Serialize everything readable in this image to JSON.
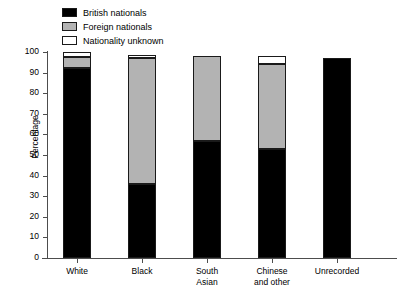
{
  "chart_data": {
    "type": "bar",
    "subtype": "stacked-bar",
    "title": "",
    "xlabel": "",
    "ylabel": "Percentage",
    "ylim": [
      0,
      100
    ],
    "yticks": [
      0,
      10,
      20,
      30,
      40,
      50,
      60,
      70,
      80,
      90,
      100
    ],
    "grid": false,
    "legend_position": "top-left",
    "categories": [
      "White",
      "Black",
      "South Asian",
      "Chinese and other",
      "Unrecorded"
    ],
    "category_lines": [
      [
        "White"
      ],
      [
        "Black"
      ],
      [
        "South",
        "Asian"
      ],
      [
        "Chinese",
        "and other"
      ],
      [
        "Unrecorded"
      ]
    ],
    "series": [
      {
        "name": "British nationals",
        "color": "#000000",
        "values": [
          92,
          36,
          57,
          53,
          97
        ]
      },
      {
        "name": "Foreign nationals",
        "color": "#b3b3b3",
        "values": [
          5.5,
          61,
          41,
          41,
          0
        ]
      },
      {
        "name": "Nationality unknown",
        "color": "#ffffff",
        "values": [
          2.5,
          1.5,
          0,
          4,
          0
        ]
      }
    ],
    "bar_totals": [
      100,
      98.5,
      98,
      98,
      97
    ]
  },
  "legend": {
    "items": [
      {
        "label": "British nationals",
        "swatch": "#000000"
      },
      {
        "label": "Foreign nationals",
        "swatch": "#b3b3b3"
      },
      {
        "label": "Nationality unknown",
        "swatch": "#ffffff"
      }
    ]
  },
  "axes": {
    "y_title": "Percentage",
    "y_tick_labels": [
      "100",
      "90",
      "80",
      "70",
      "60",
      "50",
      "40",
      "30",
      "20",
      "10",
      "0"
    ]
  },
  "colors": {
    "british": "#000000",
    "foreign": "#b3b3b3",
    "unknown": "#ffffff",
    "axis": "#4d4d4d",
    "outline": "#1a1a1a",
    "background": "#ffffff"
  }
}
